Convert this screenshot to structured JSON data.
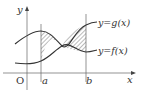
{
  "diagram": {
    "axes": {
      "x_label": "x",
      "y_label": "y",
      "origin_label": "O"
    },
    "bounds": {
      "a_label": "a",
      "b_label": "b"
    },
    "curves": [
      {
        "name": "g",
        "label": "y=g(x)"
      },
      {
        "name": "f",
        "label": "y=f(x)"
      }
    ],
    "shaded_region": "area between y=f(x) and y=g(x) from x=a to x=b (hatched)",
    "colors": {
      "line": "#333333",
      "axis": "#666666",
      "hatch": "#555555"
    }
  }
}
